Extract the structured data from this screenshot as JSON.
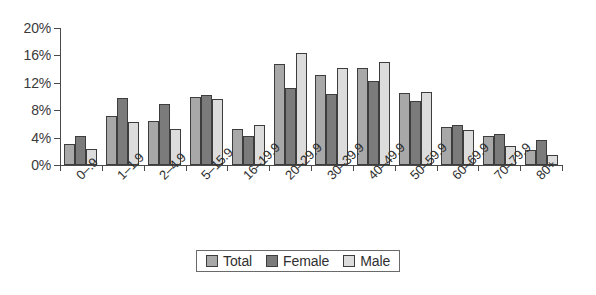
{
  "chart_data": {
    "type": "bar",
    "title": "",
    "subtitle": "",
    "xlabel": "",
    "ylabel": "",
    "ylim": [
      0,
      20
    ],
    "ytick_labels": [
      "0%",
      "4%",
      "8%",
      "12%",
      "16%",
      "20%"
    ],
    "ytick_values": [
      0,
      4,
      8,
      12,
      16,
      20
    ],
    "grid": false,
    "legend_position": "bottom-center",
    "categories": [
      "0–.9",
      "1–1.9",
      "2–4.9",
      "5–15.9",
      "16–19.9",
      "20–29.9",
      "30–39.9",
      "40–49.9",
      "50–59.9",
      "60–69.9",
      "70–79.9",
      "80+"
    ],
    "series": [
      {
        "name": "Total",
        "color": "#a8a8a8",
        "values": [
          3.0,
          7.2,
          6.4,
          10.0,
          5.2,
          14.8,
          13.1,
          14.1,
          10.5,
          5.6,
          4.2,
          2.2
        ]
      },
      {
        "name": "Female",
        "color": "#7b7b7b",
        "values": [
          4.2,
          9.8,
          8.9,
          10.2,
          4.3,
          11.2,
          10.4,
          12.2,
          9.4,
          5.9,
          4.5,
          3.7
        ]
      },
      {
        "name": "Male",
        "color": "#dcdcdc",
        "values": [
          2.4,
          6.3,
          5.2,
          9.7,
          5.8,
          16.3,
          14.2,
          15.0,
          10.6,
          5.1,
          2.8,
          1.5
        ]
      }
    ]
  },
  "legend": {
    "items": [
      {
        "label": "Total",
        "key": "total"
      },
      {
        "label": "Female",
        "key": "female"
      },
      {
        "label": "Male",
        "key": "male"
      }
    ]
  }
}
